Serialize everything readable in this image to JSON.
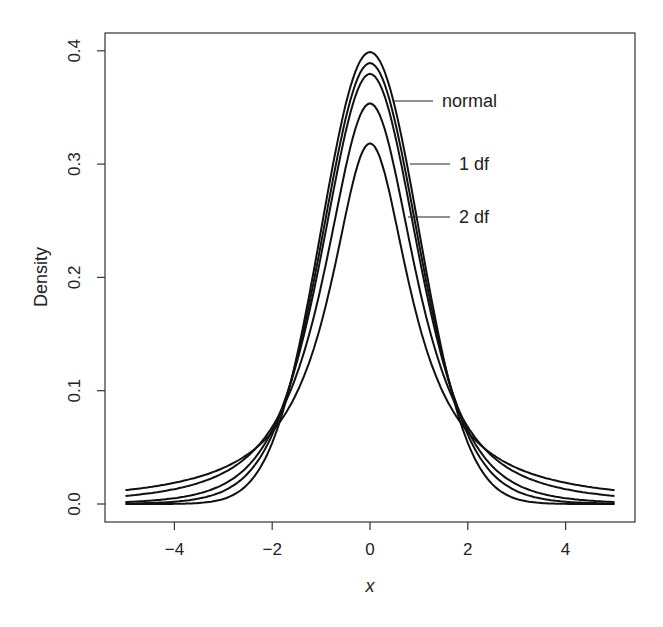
{
  "chart_data": {
    "type": "line",
    "title": "",
    "xlabel": "x",
    "ylabel": "Density",
    "xlim": [
      -5,
      5
    ],
    "ylim": [
      0,
      0.4
    ],
    "xticks": [
      -4,
      -2,
      0,
      2,
      4
    ],
    "xtick_labels": [
      "−4",
      "−2",
      "0",
      "2",
      "4"
    ],
    "yticks": [
      0.0,
      0.1,
      0.2,
      0.3,
      0.4
    ],
    "ytick_labels": [
      "0.0",
      "0.1",
      "0.2",
      "0.3",
      "0.4"
    ],
    "grid": false,
    "legend": "none (inline annotations)",
    "series": [
      {
        "name": "normal",
        "dist": "normal",
        "peak": 0.399
      },
      {
        "name": "t 10 df",
        "dist": "t",
        "df": 10,
        "peak": 0.389
      },
      {
        "name": "t 5 df",
        "dist": "t",
        "df": 5,
        "peak": 0.38
      },
      {
        "name": "2 df",
        "dist": "t",
        "df": 2,
        "peak": 0.354
      },
      {
        "name": "1 df",
        "dist": "t",
        "df": 1,
        "peak": 0.318
      }
    ],
    "annotations": [
      {
        "text": "normal",
        "x": 1.6,
        "y": 0.352
      },
      {
        "text": "1 df",
        "x": 1.65,
        "y": 0.305
      },
      {
        "text": "2 df",
        "x": 1.65,
        "y": 0.258
      }
    ]
  }
}
